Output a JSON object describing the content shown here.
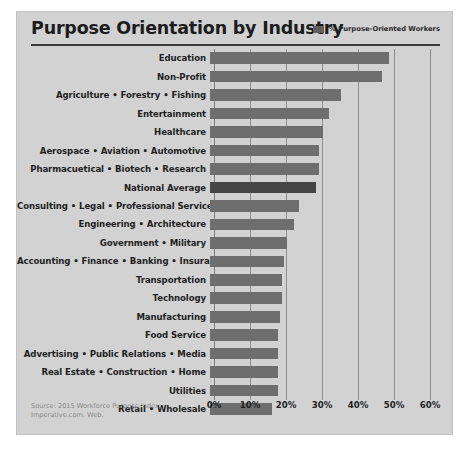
{
  "header": {
    "title": "Purpose Orientation by Industry",
    "legend_label": "% Purpose-Oriented Workers"
  },
  "footer": {
    "source_line_1": "Source: 2015 Workforce Purpose Index.",
    "source_line_2": "Imperative.com. Web."
  },
  "colors": {
    "card_background": "#d2d2d2",
    "bar": "#6e6e6e",
    "bar_highlight": "#464646",
    "gridline": "#8e8e8e",
    "title": "#1c1c1c",
    "source_text": "#8a8a8a"
  },
  "chart_data": {
    "type": "bar",
    "orientation": "horizontal",
    "title": "Purpose Orientation by Industry",
    "xlabel": "",
    "ylabel": "",
    "xlim": [
      0,
      62
    ],
    "grid": true,
    "legend_position": "top-right",
    "legend": [
      "% Purpose-Oriented Workers"
    ],
    "tick_labels": [
      "0%",
      "10%",
      "20%",
      "30%",
      "40%",
      "50%",
      "60%"
    ],
    "tick_values": [
      0,
      10,
      20,
      30,
      40,
      50,
      60
    ],
    "highlight_category": "National Average",
    "categories": [
      "Education",
      "Non-Profit",
      "Agriculture • Forestry • Fishing",
      "Entertainment",
      "Healthcare",
      "Aerospace • Aviation • Automotive",
      "Pharmacuetical • Biotech • Research",
      "National Average",
      "Consulting • Legal • Professional Services",
      "Engineering • Architecture",
      "Government • Military",
      "Accounting • Finance • Banking • Insurance",
      "Transportation",
      "Technology",
      "Manufacturing",
      "Food Service",
      "Advertising • Public Relations • Media",
      "Real Estate • Construction • Home",
      "Utilities",
      "Retail • Wholesale"
    ],
    "values": [
      49.7,
      47.8,
      36.5,
      33.0,
      31.5,
      30.3,
      30.3,
      29.4,
      24.7,
      23.3,
      21.4,
      20.5,
      20.0,
      20.0,
      19.4,
      19.0,
      18.9,
      18.9,
      18.9,
      17.2
    ]
  }
}
